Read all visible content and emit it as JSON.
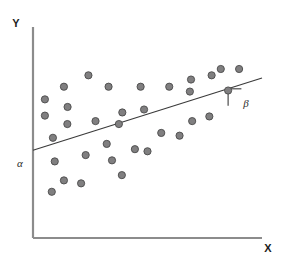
{
  "figure": {
    "title": "",
    "background_color": "#ffffff"
  },
  "axes": {
    "y_axis_label": "Y",
    "x_axis_label": "X",
    "axis_color": "#8c8c8c",
    "origin_px": {
      "x": 33,
      "y": 238
    },
    "y_axis_top_px": 27,
    "x_axis_right_px": 262
  },
  "annotations": {
    "intercept_label": "α",
    "slope_angle_label": "β",
    "intercept_label_px": {
      "x": 20,
      "y": 167
    },
    "slope_angle_label_px": {
      "x": 246,
      "y": 107
    }
  },
  "style": {
    "point_fill": "#807f80",
    "point_stroke": "#4a4a4a",
    "point_radius": 3.6,
    "line_color": "#3a3a3a",
    "angle_marker_color": "#3a3a3a"
  },
  "chart_data": {
    "type": "scatter",
    "title": "",
    "xlabel": "X",
    "ylabel": "Y",
    "xlim": [
      0,
      100
    ],
    "ylim": [
      0,
      100
    ],
    "grid": false,
    "legend": "none",
    "annotations": [
      {
        "text": "α",
        "meaning": "intercept of regression line on Y axis",
        "x": 0,
        "y": 41.6
      },
      {
        "text": "β",
        "meaning": "slope angle of regression line",
        "x": 92.3,
        "y": 77.1
      }
    ],
    "regression_line": {
      "x": [
        0,
        100
      ],
      "y": [
        41.6,
        75.8
      ],
      "intercept": 41.6,
      "slope": 0.342,
      "color": "#3a3a3a"
    },
    "slope_triangle": {
      "apex_x": 85.2,
      "apex_y": 70.7,
      "corner_x": 91.0,
      "corner_y": 70.7,
      "base_x": 85.2,
      "base_y": 62.7
    },
    "points": [
      {
        "x": 8.7,
        "y": 47.5
      },
      {
        "x": 5.2,
        "y": 58.0
      },
      {
        "x": 13.5,
        "y": 71.7
      },
      {
        "x": 5.2,
        "y": 65.7
      },
      {
        "x": 24.2,
        "y": 77.1
      },
      {
        "x": 15.1,
        "y": 62.1
      },
      {
        "x": 15.0,
        "y": 54.0
      },
      {
        "x": 9.5,
        "y": 36.3
      },
      {
        "x": 13.5,
        "y": 27.3
      },
      {
        "x": 8.2,
        "y": 21.9
      },
      {
        "x": 21.0,
        "y": 25.9
      },
      {
        "x": 23.0,
        "y": 39.3
      },
      {
        "x": 27.3,
        "y": 55.4
      },
      {
        "x": 33.0,
        "y": 71.7
      },
      {
        "x": 34.5,
        "y": 36.8
      },
      {
        "x": 38.8,
        "y": 29.8
      },
      {
        "x": 32.2,
        "y": 44.6
      },
      {
        "x": 39.0,
        "y": 59.5
      },
      {
        "x": 44.5,
        "y": 42.1
      },
      {
        "x": 50.0,
        "y": 41.1
      },
      {
        "x": 47.0,
        "y": 71.7
      },
      {
        "x": 48.5,
        "y": 60.9
      },
      {
        "x": 56.0,
        "y": 49.8
      },
      {
        "x": 59.5,
        "y": 71.7
      },
      {
        "x": 64.0,
        "y": 48.5
      },
      {
        "x": 69.0,
        "y": 75.1
      },
      {
        "x": 68.5,
        "y": 69.4
      },
      {
        "x": 69.5,
        "y": 55.4
      },
      {
        "x": 78.0,
        "y": 77.1
      },
      {
        "x": 77.0,
        "y": 57.6
      },
      {
        "x": 82.0,
        "y": 80.1
      },
      {
        "x": 85.2,
        "y": 69.9
      },
      {
        "x": 90.0,
        "y": 80.1
      },
      {
        "x": 37.5,
        "y": 54.0
      }
    ]
  }
}
